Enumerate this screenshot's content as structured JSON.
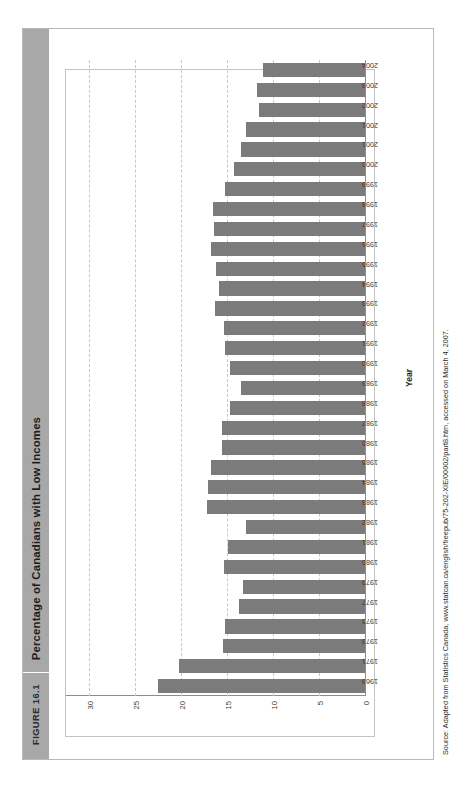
{
  "figure": {
    "tag": "FIGURE 16.1",
    "title": "Percentage of Canadians with Low Incomes",
    "source": "Source: Adapted from Statistics Canada, www.statcan.ca/english/freepub/75-202-XIE/00002/part8.htm, accessed on March 4, 2007."
  },
  "chart_data": {
    "type": "bar",
    "orientation": "horizontal",
    "title": "Percentage of Canadians with Low Incomes",
    "xlabel": "Year",
    "ylabel": "",
    "ylim": [
      0,
      30
    ],
    "yticks": [
      0,
      5,
      10,
      15,
      20,
      25,
      30
    ],
    "grid": true,
    "legend": false,
    "bar_color": "#7b7b7b",
    "categories": [
      "1969",
      "1971",
      "1973",
      "1975",
      "1977",
      "1979",
      "1980",
      "1981",
      "1982",
      "1983",
      "1984",
      "1985",
      "1986",
      "1987",
      "1988",
      "1989",
      "1990",
      "1991",
      "1992",
      "1993",
      "1994",
      "1995",
      "1996",
      "1997",
      "1998",
      "1999",
      "2000",
      "2001",
      "2001",
      "2002",
      "2003",
      "2004"
    ],
    "values": [
      22.6,
      20.3,
      15.5,
      15.3,
      13.8,
      13.4,
      15.4,
      15.0,
      13.0,
      17.3,
      17.2,
      16.8,
      15.6,
      15.7,
      14.8,
      13.6,
      14.8,
      15.3,
      15.4,
      16.4,
      16.0,
      16.3,
      16.8,
      16.5,
      16.6,
      15.3,
      14.4,
      13.6,
      13.0,
      11.6,
      11.8,
      11.2
    ]
  }
}
